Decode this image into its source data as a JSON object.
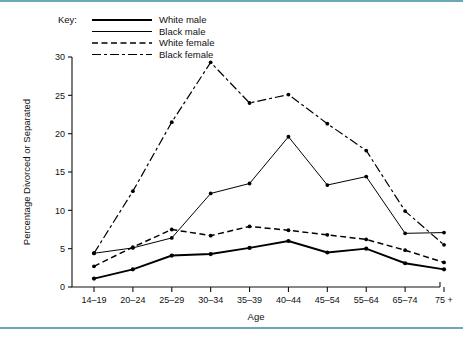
{
  "figure": {
    "background_color": "#ffffff",
    "rule_color": "#6aa9b4"
  },
  "legend": {
    "key_label": "Key:",
    "entries": [
      {
        "label": "White male",
        "style": "solid-thick"
      },
      {
        "label": "Black male",
        "style": "solid-thin"
      },
      {
        "label": "White female",
        "style": "dashed"
      },
      {
        "label": "Black female",
        "style": "dash-dot"
      }
    ]
  },
  "chart_data": {
    "type": "line",
    "title": "",
    "xlabel": "Age",
    "ylabel": "Percentage Divorced or Separated",
    "categories": [
      "14–19",
      "20–24",
      "25–29",
      "30–34",
      "35–39",
      "40–44",
      "45–54",
      "55–64",
      "65–74",
      "75 +"
    ],
    "ylim": [
      0,
      30
    ],
    "yticks": [
      0,
      5,
      10,
      15,
      20,
      25,
      30
    ],
    "ytick_labels": [
      "0",
      "5",
      "10",
      "15",
      "20",
      "25",
      "30"
    ],
    "grid": false,
    "legend_position": "top-left",
    "series": [
      {
        "name": "White male",
        "style": "solid-thick",
        "values": [
          1.1,
          2.3,
          4.1,
          4.3,
          5.1,
          6.0,
          4.5,
          5.0,
          3.1,
          2.3
        ]
      },
      {
        "name": "Black male",
        "style": "solid-thin",
        "values": [
          4.4,
          5.1,
          6.4,
          12.2,
          13.5,
          19.6,
          13.3,
          14.4,
          7.0,
          7.1
        ]
      },
      {
        "name": "White female",
        "style": "dashed",
        "values": [
          2.7,
          5.2,
          7.5,
          6.7,
          7.9,
          7.4,
          6.8,
          6.2,
          4.8,
          3.2
        ]
      },
      {
        "name": "Black female",
        "style": "dash-dot",
        "values": [
          4.4,
          12.5,
          21.5,
          29.3,
          24.0,
          25.1,
          21.3,
          17.8,
          9.9,
          5.5
        ]
      }
    ]
  }
}
